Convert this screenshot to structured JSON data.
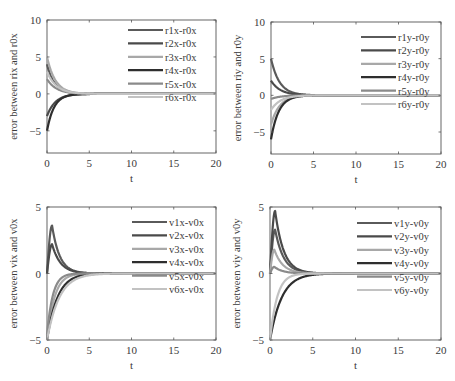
{
  "figure": {
    "subplot_count": 4
  },
  "chart_data": [
    {
      "type": "line",
      "title": "",
      "xlabel": "t",
      "ylabel": "error between rix and r0x",
      "xlim": [
        0,
        20
      ],
      "ylim": [
        -8,
        10
      ],
      "xticks": [
        0,
        5,
        10,
        15,
        20
      ],
      "yticks": [
        -5,
        0,
        5,
        10
      ],
      "grid": false,
      "legend_position": "upper right (inside, no frame)",
      "box": {
        "left": 47,
        "top": 20,
        "right": 216,
        "bottom": 153
      },
      "legend_box": {
        "x": 128,
        "y": 30,
        "dy": 13.4
      },
      "series": [
        {
          "name": "r1x-r0x",
          "color": "#5a5a5a",
          "width": 2.2,
          "shape": "decay",
          "initial": 4.0,
          "rate": 1.1
        },
        {
          "name": "r2x-r0x",
          "color": "#4a4a4a",
          "width": 2.2,
          "shape": "decay",
          "initial": -3.0,
          "rate": 1.0
        },
        {
          "name": "r3x-r0x",
          "color": "#a8a8a8",
          "width": 2.2,
          "shape": "decay",
          "initial": 5.0,
          "rate": 1.0
        },
        {
          "name": "r4x-r0x",
          "color": "#2e2e2e",
          "width": 2.2,
          "shape": "decay",
          "initial": -5.0,
          "rate": 1.2
        },
        {
          "name": "r5x-r0x",
          "color": "#8a8a8a",
          "width": 2.2,
          "shape": "decay",
          "initial": 2.0,
          "rate": 0.9
        },
        {
          "name": "r6x-r0x",
          "color": "#c2c2c2",
          "width": 2.2,
          "shape": "decay",
          "initial": 3.0,
          "rate": 0.9
        }
      ]
    },
    {
      "type": "line",
      "title": "",
      "xlabel": "t",
      "ylabel": "error between riy and r0y",
      "xlim": [
        0,
        20
      ],
      "ylim": [
        -8,
        10
      ],
      "xticks": [
        0,
        5,
        10,
        15,
        20
      ],
      "yticks": [
        -5,
        0,
        5,
        10
      ],
      "grid": false,
      "legend_position": "upper right (inside, no frame)",
      "box": {
        "left": 271,
        "top": 22,
        "right": 441,
        "bottom": 154
      },
      "legend_box": {
        "x": 361,
        "y": 37,
        "dy": 13.4
      },
      "series": [
        {
          "name": "r1y-r0y",
          "color": "#5a5a5a",
          "width": 2.2,
          "shape": "decay",
          "initial": 5.0,
          "rate": 1.0
        },
        {
          "name": "r2y-r0y",
          "color": "#4a4a4a",
          "width": 2.2,
          "shape": "decay",
          "initial": 2.0,
          "rate": 0.9
        },
        {
          "name": "r3y-r0y",
          "color": "#a8a8a8",
          "width": 2.2,
          "shape": "decay",
          "initial": -4.0,
          "rate": 1.0
        },
        {
          "name": "r4y-r0y",
          "color": "#2e2e2e",
          "width": 2.2,
          "shape": "decay",
          "initial": -6.0,
          "rate": 1.1
        },
        {
          "name": "r5y-r0y",
          "color": "#8a8a8a",
          "width": 2.2,
          "shape": "decay",
          "initial": -0.5,
          "rate": 0.9
        },
        {
          "name": "r6y-r0y",
          "color": "#c2c2c2",
          "width": 2.2,
          "shape": "decay",
          "initial": -2.0,
          "rate": 0.9
        }
      ]
    },
    {
      "type": "line",
      "title": "",
      "xlabel": "t",
      "ylabel": "error between vix and v0x",
      "xlim": [
        0,
        20
      ],
      "ylim": [
        -5,
        5
      ],
      "xticks": [
        0,
        5,
        10,
        15,
        20
      ],
      "yticks": [
        -5,
        0,
        5
      ],
      "grid": false,
      "legend_position": "upper right (inside, no frame)",
      "box": {
        "left": 47,
        "top": 207,
        "right": 216,
        "bottom": 340
      },
      "legend_box": {
        "x": 132,
        "y": 222,
        "dy": 13.4
      },
      "series": [
        {
          "name": "v1x-v0x",
          "color": "#5a5a5a",
          "width": 2.2,
          "shape": "peak",
          "initial": 0,
          "peak": 3.6,
          "t_peak": 0.6,
          "rate": 1.1
        },
        {
          "name": "v2x-v0x",
          "color": "#4a4a4a",
          "width": 2.2,
          "shape": "peak",
          "initial": 0,
          "peak": 2.2,
          "t_peak": 0.6,
          "rate": 1.0
        },
        {
          "name": "v3x-v0x",
          "color": "#a8a8a8",
          "width": 2.2,
          "shape": "recover",
          "initial": -5.0,
          "rate": 1.4
        },
        {
          "name": "v4x-v0x",
          "color": "#2e2e2e",
          "width": 2.2,
          "shape": "recover",
          "initial": -5.0,
          "rate": 1.0
        },
        {
          "name": "v5x-v0x",
          "color": "#8a8a8a",
          "width": 2.2,
          "shape": "recover",
          "initial": -4.6,
          "rate": 1.8
        },
        {
          "name": "v6x-v0x",
          "color": "#c2c2c2",
          "width": 2.2,
          "shape": "recover",
          "initial": -5.0,
          "rate": 0.85
        }
      ]
    },
    {
      "type": "line",
      "title": "",
      "xlabel": "t",
      "ylabel": "error between viy and v0y",
      "xlim": [
        0,
        20
      ],
      "ylim": [
        -5,
        5
      ],
      "xticks": [
        0,
        5,
        10,
        15,
        20
      ],
      "yticks": [
        -5,
        0,
        5
      ],
      "grid": false,
      "legend_position": "upper right (inside, no frame)",
      "box": {
        "left": 270,
        "top": 207,
        "right": 441,
        "bottom": 340
      },
      "legend_box": {
        "x": 357,
        "y": 223,
        "dy": 13.4
      },
      "series": [
        {
          "name": "v1y-v0y",
          "color": "#5a5a5a",
          "width": 2.2,
          "shape": "peak",
          "initial": 0,
          "peak": 3.3,
          "t_peak": 0.6,
          "rate": 1.0
        },
        {
          "name": "v2y-v0y",
          "color": "#4a4a4a",
          "width": 2.2,
          "shape": "peak",
          "initial": 0,
          "peak": 4.7,
          "t_peak": 0.6,
          "rate": 1.0
        },
        {
          "name": "v3y-v0y",
          "color": "#a8a8a8",
          "width": 2.2,
          "shape": "peak",
          "initial": 0,
          "peak": 1.8,
          "t_peak": 0.5,
          "rate": 1.0
        },
        {
          "name": "v4y-v0y",
          "color": "#2e2e2e",
          "width": 2.2,
          "shape": "recover",
          "initial": -5.0,
          "rate": 0.9
        },
        {
          "name": "v5y-v0y",
          "color": "#8a8a8a",
          "width": 2.2,
          "shape": "peak",
          "initial": 0,
          "peak": 0.5,
          "t_peak": 0.5,
          "rate": 1.0
        },
        {
          "name": "v6y-v0y",
          "color": "#c2c2c2",
          "width": 2.2,
          "shape": "recover",
          "initial": -5.0,
          "rate": 1.5
        }
      ]
    }
  ]
}
